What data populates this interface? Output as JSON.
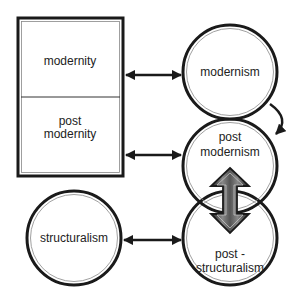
{
  "diagram": {
    "rectangle": {
      "top_label": "modernity",
      "bottom_label_line1": "post",
      "bottom_label_line2": "modernity"
    },
    "nodes": {
      "modernism": {
        "label": "modernism"
      },
      "post_modernism": {
        "label_line1": "post",
        "label_line2": "modernism"
      },
      "structuralism": {
        "label": "structuralism"
      },
      "post_structuralism": {
        "label_line1": "post -",
        "label_line2": "structuralism"
      }
    },
    "connectors": [
      {
        "from": "modernity",
        "to": "modernism",
        "type": "bidirectional"
      },
      {
        "from": "post modernity",
        "to": "post modernism",
        "type": "bidirectional"
      },
      {
        "from": "structuralism",
        "to": "post-structuralism",
        "type": "bidirectional"
      },
      {
        "from": "modernism",
        "to": "post modernism",
        "type": "curved-directional"
      },
      {
        "from": "post modernism",
        "to": "post-structuralism",
        "type": "bidirectional-3d"
      }
    ],
    "colors": {
      "stroke": "#1a1a1a",
      "inner_ring": "#777777",
      "background": "#ffffff"
    }
  }
}
